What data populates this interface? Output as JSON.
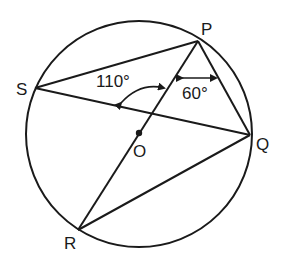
{
  "diagram": {
    "circle": {
      "cx": 139,
      "cy": 134,
      "r": 113,
      "center_label": "O"
    },
    "points": {
      "P": {
        "label": "P",
        "x": 198,
        "y": 41
      },
      "Q": {
        "label": "Q",
        "x": 250,
        "y": 135
      },
      "R": {
        "label": "R",
        "x": 78,
        "y": 230
      },
      "S": {
        "label": "S",
        "x": 35,
        "y": 88
      },
      "O": {
        "label": "O",
        "x": 139,
        "y": 133
      }
    },
    "segments": [
      "PS",
      "PQ",
      "PR",
      "SQ",
      "RQ"
    ],
    "angles": {
      "angle_1": {
        "label": "110°",
        "description": "angle between SQ and PR at their intersection"
      },
      "angle_2": {
        "label": "60°",
        "description": "angle RPQ at P"
      }
    },
    "stroke_color": "#1a1a1a",
    "background": "#ffffff"
  }
}
